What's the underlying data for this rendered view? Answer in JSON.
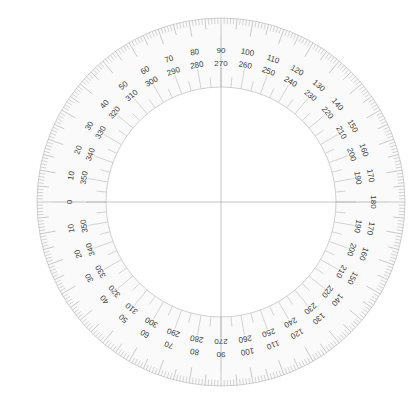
{
  "diagram": {
    "center": {
      "x": 221,
      "y": 202
    },
    "outer_radius": 184,
    "inner_radius": 115,
    "outer_label_radius": 152,
    "inner_label_radius": 139,
    "tick_step_degrees": 1,
    "colors": {
      "background": "#ffffff",
      "ring_fill": "#fafafa",
      "tick": "#b8b8b8",
      "major_tick": "#a8a8a8",
      "label": "#3a3a3a",
      "crosshair": "#9a9a9a",
      "circle_stroke": "#c4c4c4"
    },
    "top_half": {
      "outer_labels": [
        "0",
        "10",
        "20",
        "30",
        "40",
        "50",
        "60",
        "70",
        "80",
        "90",
        "100",
        "110",
        "120",
        "130",
        "140",
        "150",
        "160",
        "170",
        "180"
      ],
      "inner_labels": [
        "",
        "350",
        "340",
        "330",
        "320",
        "310",
        "300",
        "290",
        "280",
        "270",
        "260",
        "250",
        "240",
        "230",
        "220",
        "210",
        "200",
        "190",
        ""
      ]
    },
    "bottom_half": {
      "outer_labels": [
        "0",
        "10",
        "20",
        "30",
        "40",
        "50",
        "60",
        "70",
        "80",
        "90",
        "100",
        "110",
        "120",
        "130",
        "140",
        "150",
        "160",
        "170",
        "180"
      ],
      "inner_labels": [
        "",
        "350",
        "340",
        "330",
        "320",
        "310",
        "300",
        "290",
        "280",
        "270",
        "260",
        "250",
        "240",
        "230",
        "220",
        "210",
        "200",
        "190",
        ""
      ]
    },
    "crosshair": {
      "horizontal": true,
      "vertical": true
    }
  }
}
